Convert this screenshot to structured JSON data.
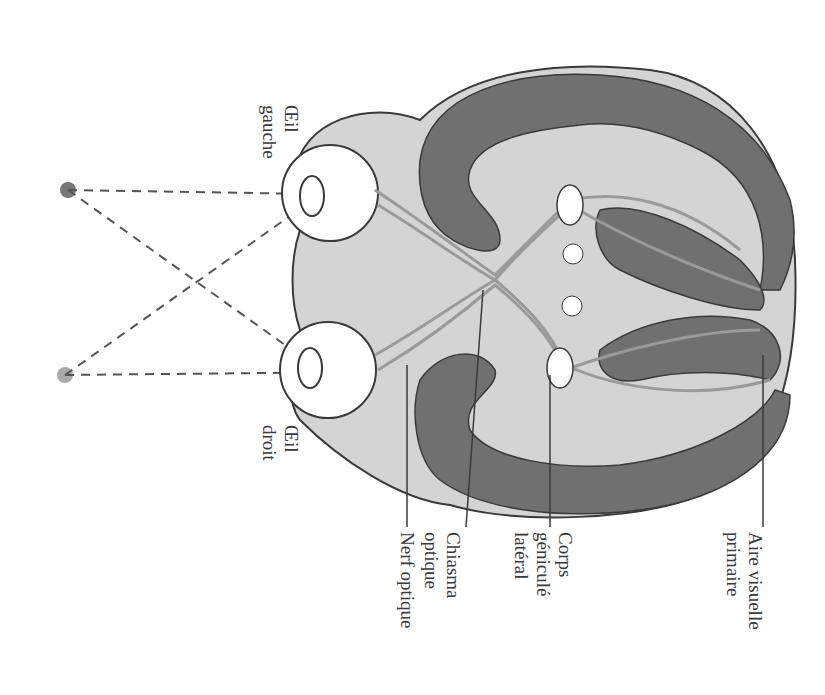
{
  "labels": {
    "oeil_gauche": [
      "Œil",
      "gauche"
    ],
    "oeil_droit": [
      "Œil",
      "droit"
    ],
    "nerf_optique": "Nerf optique",
    "chiasma_optique": [
      "Chiasma",
      "optique"
    ],
    "corps_genicule_lateral": [
      "Corps",
      "géniculé",
      "latéral"
    ],
    "aire_visuelle_primaire": [
      "Aire visuelle",
      "primaire"
    ]
  },
  "colors": {
    "background": "#ffffff",
    "brain_fill": "#d4d4d4",
    "cortex_dark": "#707070",
    "outline": "#3a3a3a",
    "fibers": "#9a9a9a",
    "point_dark": "#777777",
    "point_light": "#aaaaaa",
    "text": "#3a3a3a"
  }
}
